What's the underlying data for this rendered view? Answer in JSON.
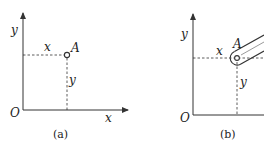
{
  "figure": {
    "panels": [
      {
        "id": "a",
        "caption": "(a)",
        "axis_x_label": "x",
        "axis_y_label": "y",
        "origin_label": "O",
        "point_label": "A",
        "coord_x_label": "x",
        "coord_y_label": "y"
      },
      {
        "id": "b",
        "caption": "(b)",
        "axis_y_label": "y",
        "origin_label": "O",
        "point_label": "A",
        "coord_x_label": "x",
        "coord_y_label": "y"
      }
    ],
    "colors": {
      "line": "#333333",
      "background": "#ffffff"
    }
  }
}
